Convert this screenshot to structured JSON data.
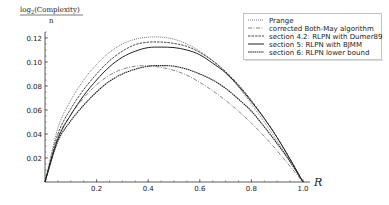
{
  "chart_data": {
    "type": "line",
    "title": "",
    "ylabel": "log2(Complexity) / n",
    "ylabel_numerator": "log",
    "ylabel_sub": "2",
    "ylabel_rest": "(Complexity)",
    "ylabel_denominator": "n",
    "xlabel": "R",
    "xlim": [
      0,
      1
    ],
    "ylim": [
      0,
      0.12
    ],
    "xticks": [
      "0.2",
      "0.4",
      "0.6",
      "0.8",
      "1.0"
    ],
    "yticks": [
      "0.02",
      "0.04",
      "0.06",
      "0.08",
      "0.10",
      "0.12"
    ],
    "grid": false,
    "legend_position": "upper right",
    "x": [
      0,
      0.05,
      0.1,
      0.15,
      0.2,
      0.25,
      0.3,
      0.35,
      0.4,
      0.45,
      0.5,
      0.55,
      0.6,
      0.65,
      0.7,
      0.75,
      0.8,
      0.85,
      0.9,
      0.95,
      1.0
    ],
    "series": [
      {
        "name": "Prange",
        "style": "dotted",
        "values": [
          0,
          0.045,
          0.068,
          0.085,
          0.098,
          0.108,
          0.115,
          0.119,
          0.1207,
          0.1207,
          0.119,
          0.115,
          0.109,
          0.101,
          0.091,
          0.079,
          0.065,
          0.05,
          0.034,
          0.017,
          0
        ]
      },
      {
        "name": "corrected Both-May algorithm",
        "style": "dashdot",
        "values": [
          0,
          0.037,
          0.056,
          0.07,
          0.081,
          0.089,
          0.094,
          0.0965,
          0.0968,
          0.0955,
          0.093,
          0.089,
          0.083,
          0.076,
          0.068,
          0.059,
          0.049,
          0.038,
          0.026,
          0.013,
          0
        ]
      },
      {
        "name": "section 4.2: RLPN with Dumer89",
        "style": "dashed",
        "values": [
          0,
          0.04,
          0.061,
          0.077,
          0.09,
          0.101,
          0.109,
          0.1145,
          0.1165,
          0.1166,
          0.1155,
          0.113,
          0.108,
          0.101,
          0.092,
          0.081,
          0.068,
          0.053,
          0.037,
          0.019,
          0
        ]
      },
      {
        "name": "section 5: RLPN with BJMM",
        "style": "solid",
        "values": [
          0,
          0.036,
          0.056,
          0.072,
          0.085,
          0.096,
          0.104,
          0.109,
          0.112,
          0.1124,
          0.112,
          0.11,
          0.106,
          0.099,
          0.091,
          0.08,
          0.067,
          0.053,
          0.037,
          0.019,
          0
        ]
      },
      {
        "name": "section 6: RLPN lower bound",
        "style": "densedash",
        "values": [
          0,
          0.034,
          0.051,
          0.064,
          0.075,
          0.084,
          0.09,
          0.094,
          0.0965,
          0.097,
          0.0965,
          0.094,
          0.09,
          0.085,
          0.078,
          0.069,
          0.059,
          0.046,
          0.032,
          0.017,
          0
        ]
      }
    ]
  }
}
